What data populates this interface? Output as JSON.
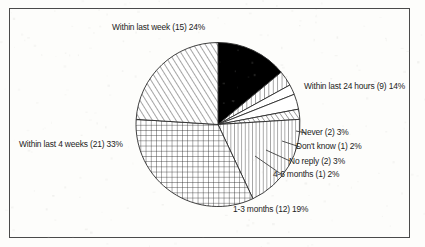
{
  "figure": {
    "frame_color": "#4a4a4a",
    "background_color": "#fdfdfb",
    "text_color": "#1c1c1c"
  },
  "chart_data": {
    "type": "pie",
    "title": "",
    "subtitle": "",
    "xlabel": "",
    "ylabel": "",
    "grid": false,
    "legend_position": "none",
    "total_count": 63,
    "start_angle_deg": 0,
    "direction": "clockwise",
    "categories": [
      "Within last 24 hours",
      "Never",
      "Don't know",
      "No reply",
      "4-6 months",
      "1-3 months",
      "Within last 4 weeks",
      "Within last week"
    ],
    "values": [
      14,
      3,
      2,
      3,
      2,
      19,
      33,
      24
    ],
    "counts": [
      9,
      2,
      1,
      2,
      1,
      12,
      21,
      15
    ],
    "slices": [
      {
        "label": "Within last 24 hours (9) 14%",
        "category": "Within last 24 hours",
        "count": 9,
        "percent": 14,
        "fill": "solid-black",
        "color": "#000000"
      },
      {
        "label": "Never (2) 3%",
        "category": "Never",
        "count": 2,
        "percent": 3,
        "fill": "vertical-hatch",
        "color": "#ffffff"
      },
      {
        "label": "Don't know (1) 2%",
        "category": "Don't know",
        "count": 1,
        "percent": 2,
        "fill": "blank",
        "color": "#ffffff"
      },
      {
        "label": "No reply (2) 3%",
        "category": "No reply",
        "count": 2,
        "percent": 3,
        "fill": "blank",
        "color": "#ffffff"
      },
      {
        "label": "4-6 months (1) 2%",
        "category": "4-6 months",
        "count": 1,
        "percent": 2,
        "fill": "diagonal-hatch",
        "color": "#ffffff"
      },
      {
        "label": "1-3 months (12) 19%",
        "category": "1-3 months",
        "count": 12,
        "percent": 19,
        "fill": "vertical-hatch",
        "color": "#ffffff"
      },
      {
        "label": "Within last 4 weeks (21) 33%",
        "category": "Within last 4 weeks",
        "count": 21,
        "percent": 33,
        "fill": "cross-hatch",
        "color": "#ffffff"
      },
      {
        "label": "Within last week (15) 24%",
        "category": "Within last week",
        "count": 15,
        "percent": 24,
        "fill": "diagonal-hatch",
        "color": "#ffffff"
      }
    ]
  },
  "labels": {
    "within_last_week": "Within last week (15) 24%",
    "within_last_24_hours": "Within last 24 hours (9) 14%",
    "never": "Never (2) 3%",
    "dont_know": "Don't know (1) 2%",
    "no_reply": "No reply (2) 3%",
    "four_six_months": "4-6 months (1) 2%",
    "one_three_months": "1-3 months (12) 19%",
    "within_last_4_weeks": "Within last 4 weeks (21) 33%"
  }
}
